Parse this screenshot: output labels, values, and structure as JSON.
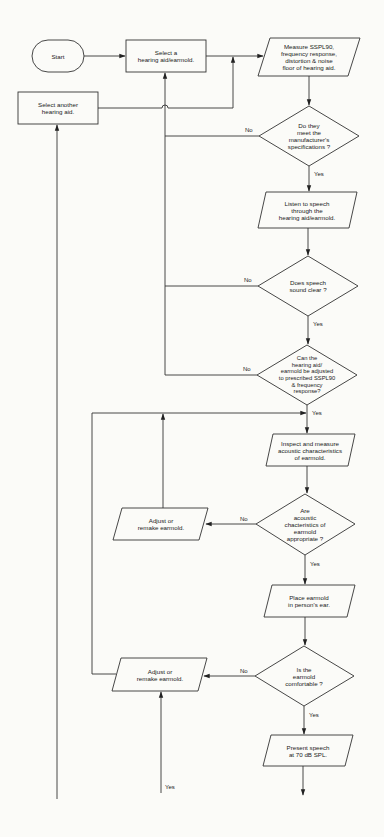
{
  "diagram": {
    "type": "flowchart",
    "stroke_color": "#333333",
    "background": "#fbfbf8",
    "nodes": {
      "start": {
        "shape": "terminator",
        "text": "Start"
      },
      "select_aid": {
        "shape": "process",
        "text": "Select a\nhearing aid/earmold."
      },
      "select_another": {
        "shape": "process",
        "text": "Select another\nhearing aid."
      },
      "measure": {
        "shape": "io",
        "text": "Measure SSPL90,\nfrequency response,\ndistortion & noise\nfloor of hearing aid."
      },
      "q_specs": {
        "shape": "decision",
        "text": "Do they\nmeet the\nmanufacturer's\nspecifications ?"
      },
      "listen": {
        "shape": "io",
        "text": "Listen to speech\nthrough the\nhearing aid/earmold."
      },
      "q_clear": {
        "shape": "decision",
        "text": "Does speech\nsound clear ?"
      },
      "q_adjust": {
        "shape": "decision",
        "text": "Can the\nhearing aid/\nearmold be adjusted\nto prescribed SSPL90\n& frequency\nresponse?"
      },
      "inspect": {
        "shape": "io",
        "text": "Inspect and measure\nacoustic characteristics\nof earmold."
      },
      "q_acoustic": {
        "shape": "decision",
        "text": "Are\nacoustic\nchacteristics of\nearmold\nappropriate ?"
      },
      "adjust_1": {
        "shape": "io",
        "text": "Adjust or\nremake earmold."
      },
      "place": {
        "shape": "io",
        "text": "Place earmold\nin person's ear."
      },
      "q_comfort": {
        "shape": "decision",
        "text": "Is the\nearmold\ncomfortable ?"
      },
      "adjust_2": {
        "shape": "io",
        "text": "Adjust or\nremake earmold."
      },
      "present": {
        "shape": "io",
        "text": "Present speech\nat 70 dB SPL."
      }
    },
    "edge_labels": {
      "specs_no": "No",
      "specs_yes": "Yes",
      "clear_no": "No",
      "clear_yes": "Yes",
      "adjust_no": "No",
      "adjust_yes": "Yes",
      "acoustic_no": "No",
      "acoustic_yes": "Yes",
      "comfort_no": "No",
      "comfort_yes": "Yes",
      "bottom_yes": "Yes"
    },
    "edges": [
      {
        "from": "start",
        "to": "select_aid"
      },
      {
        "from": "select_aid",
        "to": "measure"
      },
      {
        "from": "select_another",
        "to": "measure"
      },
      {
        "from": "measure",
        "to": "q_specs"
      },
      {
        "from": "q_specs",
        "to": "select_aid",
        "label": "No"
      },
      {
        "from": "q_specs",
        "to": "listen",
        "label": "Yes"
      },
      {
        "from": "listen",
        "to": "q_clear"
      },
      {
        "from": "q_clear",
        "to": "select_aid",
        "label": "No"
      },
      {
        "from": "q_clear",
        "to": "q_adjust",
        "label": "Yes"
      },
      {
        "from": "q_adjust",
        "to": "select_aid",
        "label": "No"
      },
      {
        "from": "q_adjust",
        "to": "inspect",
        "label": "Yes"
      },
      {
        "from": "inspect",
        "to": "q_acoustic"
      },
      {
        "from": "q_acoustic",
        "to": "adjust_1",
        "label": "No"
      },
      {
        "from": "adjust_1",
        "to": "inspect"
      },
      {
        "from": "q_acoustic",
        "to": "place",
        "label": "Yes"
      },
      {
        "from": "place",
        "to": "q_comfort"
      },
      {
        "from": "q_comfort",
        "to": "adjust_2",
        "label": "No"
      },
      {
        "from": "adjust_2",
        "to": "inspect"
      },
      {
        "from": "q_comfort",
        "to": "present",
        "label": "Yes"
      },
      {
        "from": "(continuation below)",
        "to": "adjust_2",
        "label": "Yes"
      },
      {
        "from": "(continuation below)",
        "to": "select_another"
      },
      {
        "from": "present",
        "to": "(continuation below)"
      }
    ]
  }
}
